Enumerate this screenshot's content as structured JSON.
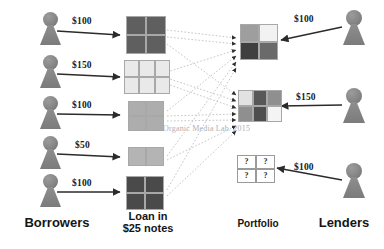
{
  "diagram": {
    "watermark": "Organic Media Lab. 2015",
    "column_headers": [
      {
        "id": "borrowers",
        "label": "Borrowers"
      },
      {
        "id": "loan-notes",
        "label": "Loan in\n$25 notes",
        "line1": "Loan in",
        "line2": "$25 notes"
      },
      {
        "id": "portfolio",
        "label": "Portfolio"
      },
      {
        "id": "lenders",
        "label": "Lenders"
      }
    ],
    "borrowers": [
      {
        "id": "borrower-1",
        "amount": "$100",
        "notes": 4,
        "grid": "2x2"
      },
      {
        "id": "borrower-2",
        "amount": "$150",
        "notes": 6,
        "grid": "3x2"
      },
      {
        "id": "borrower-3",
        "amount": "$100",
        "notes": 4,
        "grid": "2x2"
      },
      {
        "id": "borrower-4",
        "amount": "$50",
        "notes": 2,
        "grid": "2x1"
      },
      {
        "id": "borrower-5",
        "amount": "$100",
        "notes": 4,
        "grid": "2x2"
      }
    ],
    "lenders": [
      {
        "id": "lender-1",
        "amount": "$100",
        "notes": 4,
        "grid": "2x2"
      },
      {
        "id": "lender-2",
        "amount": "$150",
        "notes": 6,
        "grid": "3x2"
      },
      {
        "id": "lender-3",
        "amount": "$100",
        "notes": 4,
        "grid": "2x2",
        "unknown_marker": "?"
      }
    ],
    "unknown_marker": "?",
    "loan_boxes": [
      {
        "id": "loan-box-1",
        "cells": [
          "#5f5f5f",
          "#5f5f5f",
          "#5f5f5f",
          "#5f5f5f"
        ]
      },
      {
        "id": "loan-box-2",
        "cells": [
          "#e8e8e8",
          "#e8e8e8",
          "#e8e8e8",
          "#e8e8e8",
          "#e8e8e8",
          "#e8e8e8"
        ]
      },
      {
        "id": "loan-box-3",
        "cells": [
          "#adadad",
          "#adadad",
          "#adadad",
          "#adadad"
        ]
      },
      {
        "id": "loan-box-4",
        "cells": [
          "#b4b4b4",
          "#b4b4b4"
        ]
      },
      {
        "id": "loan-box-5",
        "cells": [
          "#4a4a4a",
          "#4a4a4a",
          "#4a4a4a",
          "#4a4a4a"
        ]
      }
    ],
    "portfolio_boxes": [
      {
        "id": "portfolio-box-1",
        "cells": [
          "#9e9e9e",
          "#f2f2f2",
          "#3f3f3f",
          "#6a6a6a"
        ]
      },
      {
        "id": "portfolio-box-2",
        "cells": [
          "#e2e2e2",
          "#585858",
          "#8f8f8f",
          "#8f8f8f",
          "#4e4e4e",
          "#f4f4f4"
        ]
      },
      {
        "id": "portfolio-box-3",
        "cells": [
          "?",
          "?",
          "?",
          "?"
        ]
      }
    ],
    "colors": {
      "figure": "#848484",
      "arrow": "#2b2b2b",
      "dotted": "#c2c2c2",
      "text": "#151515",
      "watermark": "#b0b0b0"
    }
  }
}
